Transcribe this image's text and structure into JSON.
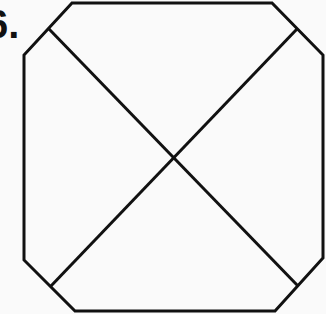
{
  "figure": {
    "label": "6.",
    "shape": "octagon-with-diagonals",
    "stroke_color": "#111111",
    "background": "#fafafa",
    "octagon_points": [
      [
        72,
        3
      ],
      [
        272,
        3
      ],
      [
        323,
        55
      ],
      [
        323,
        258
      ],
      [
        275,
        311
      ],
      [
        75,
        311
      ],
      [
        24,
        260
      ],
      [
        24,
        55
      ]
    ],
    "diagonals": [
      {
        "x1": 49,
        "y1": 29,
        "x2": 298,
        "y2": 286
      },
      {
        "x1": 297,
        "y1": 29,
        "x2": 50,
        "y2": 287
      }
    ]
  }
}
